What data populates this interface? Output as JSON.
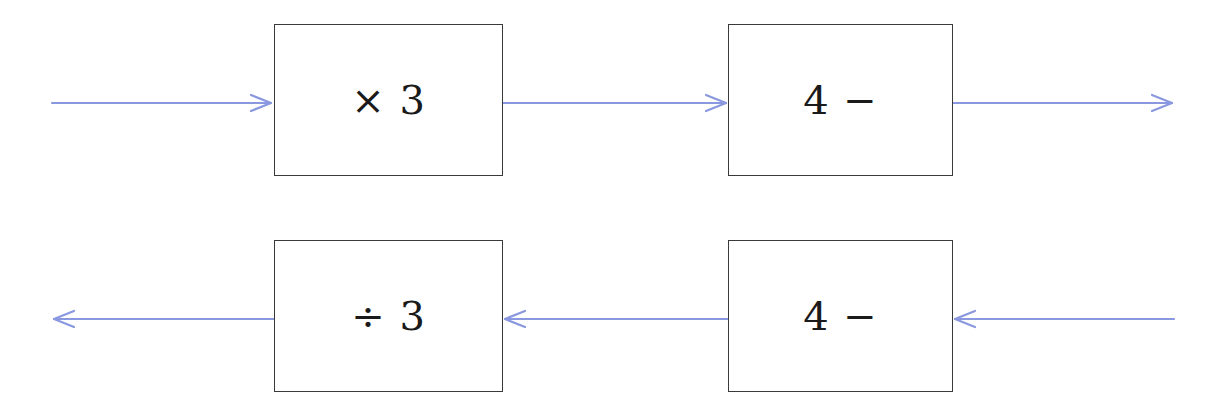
{
  "diagram": {
    "type": "function-machine",
    "arrow_color": "#8a98e0",
    "box_border_color": "#3a3a3a",
    "top_row": {
      "direction": "left-to-right",
      "boxes": [
        {
          "label": "× 3"
        },
        {
          "label": "4 −"
        }
      ]
    },
    "bottom_row": {
      "direction": "right-to-left",
      "boxes": [
        {
          "label": "÷ 3"
        },
        {
          "label": "4 −"
        }
      ]
    }
  }
}
